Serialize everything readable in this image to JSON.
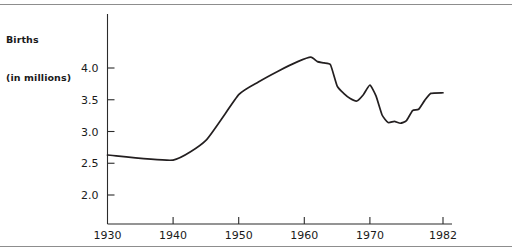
{
  "figure": {
    "axis_title_line1": "Births",
    "axis_title_line2": "(in millions)",
    "rule_color": "#8d8d8d",
    "line_color": "#231f20"
  },
  "chart_data": {
    "type": "line",
    "title": "Births (in millions)",
    "xlabel": "",
    "ylabel": "Births (in millions)",
    "grid": false,
    "legend": "none",
    "xlim": [
      1930,
      1982
    ],
    "ylim": [
      1.75,
      4.6
    ],
    "xticks": [
      1930,
      1940,
      1950,
      1960,
      1970,
      1982
    ],
    "xtick_labels": [
      "1930",
      "1940",
      "1950",
      "1960",
      "1970",
      "1982"
    ],
    "yticks": [
      2.0,
      2.5,
      3.0,
      3.5,
      4.0
    ],
    "ytick_labels": [
      "2.0",
      "2.5",
      "3.0",
      "3.5",
      "4.0"
    ],
    "series": [
      {
        "name": "Births",
        "x": [
          1930,
          1940,
          1945,
          1950,
          1953,
          1956,
          1959,
          1961,
          1962,
          1963,
          1964,
          1965,
          1966,
          1967,
          1968,
          1969,
          1970,
          1971,
          1972,
          1973,
          1974,
          1975,
          1976,
          1977,
          1978,
          1979,
          1980,
          1982
        ],
        "values": [
          2.63,
          2.55,
          2.86,
          3.58,
          3.78,
          3.95,
          4.1,
          4.17,
          4.1,
          4.08,
          4.05,
          3.72,
          3.6,
          3.52,
          3.48,
          3.58,
          3.73,
          3.56,
          3.26,
          3.14,
          3.16,
          3.13,
          3.17,
          3.33,
          3.35,
          3.49,
          3.6,
          3.61
        ]
      }
    ]
  }
}
